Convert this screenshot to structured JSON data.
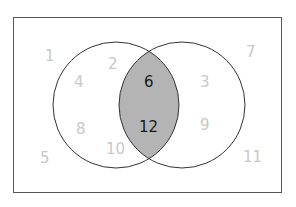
{
  "diagram": {
    "type": "venn",
    "colors": {
      "outside_number": "#c8c8c8",
      "intersection_number": "#1a1a1a",
      "intersection_fill": "#b4b4b4",
      "stroke": "#333333"
    },
    "universe": [
      "1",
      "5",
      "7",
      "11"
    ],
    "set_a_only": [
      "2",
      "4",
      "8",
      "10"
    ],
    "intersection": [
      "6",
      "12"
    ],
    "set_b_only": [
      "3",
      "9"
    ],
    "labels": {
      "n1": "1",
      "n2": "2",
      "n3": "3",
      "n4": "4",
      "n5": "5",
      "n6": "6",
      "n7": "7",
      "n8": "8",
      "n9": "9",
      "n10": "10",
      "n11": "11",
      "n12": "12"
    }
  }
}
